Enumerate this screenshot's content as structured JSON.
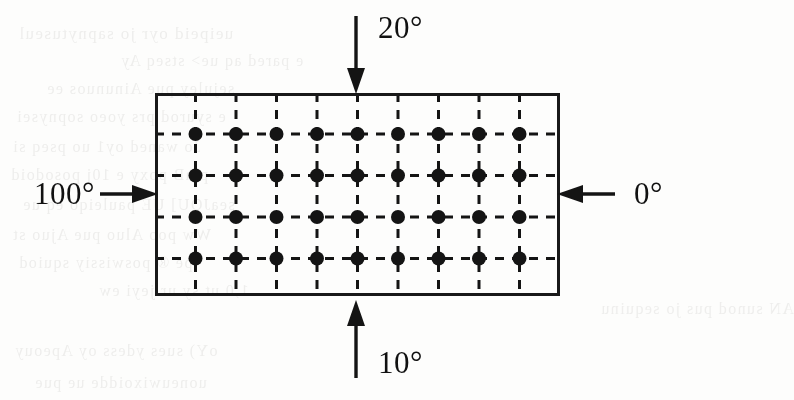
{
  "figure": {
    "type": "finite-difference-grid-diagram",
    "domain": {
      "shape": "rectangle",
      "border_color": "#191919",
      "border_width_px": 3,
      "x": 155,
      "y": 93,
      "width": 405,
      "height": 203
    },
    "grid": {
      "columns": 9,
      "rows": 4,
      "node_count": 36,
      "node_color": "#141414",
      "node_radius_px": 7,
      "line_style": "dashed",
      "line_color": "#141414",
      "line_width_px": 3,
      "dash_pattern": "9 8",
      "column_x": [
        40.5,
        81,
        121.5,
        162,
        202.5,
        243,
        283.5,
        324,
        364.5
      ],
      "row_y": [
        41,
        82.5,
        124,
        165.5
      ]
    },
    "boundary_conditions": [
      {
        "id": "top",
        "name": "top-boundary",
        "label": "20°",
        "value": 20,
        "unit": "degrees",
        "edge": "top",
        "arrow_direction": "down"
      },
      {
        "id": "left",
        "name": "left-boundary",
        "label": "100°",
        "value": 100,
        "unit": "degrees",
        "edge": "left",
        "arrow_direction": "right"
      },
      {
        "id": "right",
        "name": "right-boundary",
        "label": "0°",
        "value": 0,
        "unit": "degrees",
        "edge": "right",
        "arrow_direction": "left"
      },
      {
        "id": "bottom",
        "name": "bottom-boundary",
        "label": "10°",
        "value": 10,
        "unit": "degrees",
        "edge": "bottom",
        "arrow_direction": "up"
      }
    ]
  },
  "page_background": {
    "color": "#fdfdfc",
    "ghost_text": [
      {
        "text": "ueipeid oyr jo sapnytuseul",
        "x": 18,
        "y": 24,
        "size": 17
      },
      {
        "text": "e pared aq ue> stseq Ay",
        "x": 120,
        "y": 52,
        "size": 16
      },
      {
        "text": "sejuley pue Ainunuos ee",
        "x": 46,
        "y": 80,
        "size": 16
      },
      {
        "text": "e syurod prs yoeo sopnysei",
        "x": 16,
        "y": 108,
        "size": 16
      },
      {
        "text": "Jo waned oy1 uo pseq si",
        "x": 12,
        "y": 138,
        "size": 16
      },
      {
        "text": "piaB poxy e 10j posodoid",
        "x": 10,
        "y": 166,
        "size": 16
      },
      {
        "text": "seaJOU] UE pauleiqo eq ue",
        "x": 22,
        "y": 196,
        "size": 16
      },
      {
        "text": "Ww poo Aluo pue Ajuo st",
        "x": 12,
        "y": 226,
        "size": 16
      },
      {
        "text": "pe ® poswissiy squiod",
        "x": 18,
        "y": 254,
        "size": 16
      },
      {
        "text": "1,0     ut sy ur jeyi ew",
        "x": 98,
        "y": 282,
        "size": 16
      },
      {
        "text": "AN sunod pus jo sequinu",
        "x": 600,
        "y": 300,
        "size": 16
      },
      {
        "text": "oY) sues ydess oy Apeouy",
        "x": 14,
        "y": 342,
        "size": 16
      },
      {
        "text": "uoneuwixoidde ue pue",
        "x": 34,
        "y": 374,
        "size": 16
      }
    ]
  }
}
